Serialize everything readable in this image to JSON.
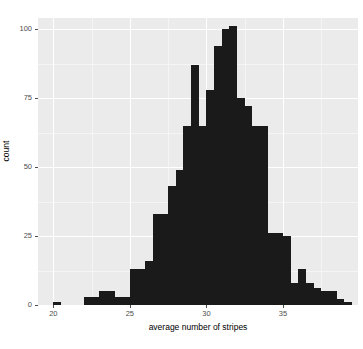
{
  "chart_data": {
    "type": "bar",
    "subtype": "histogram",
    "title": "",
    "xlabel": "average number of stripes",
    "ylabel": "count",
    "xlim": [
      19.0,
      39.9
    ],
    "ylim": [
      0,
      104
    ],
    "xticks": [
      20,
      25,
      30,
      35
    ],
    "yticks": [
      0,
      25,
      50,
      75,
      100
    ],
    "xtick_labels": [
      "20",
      "25",
      "30",
      "35"
    ],
    "ytick_labels": [
      "0",
      "25",
      "50",
      "75",
      "100"
    ],
    "grid": true,
    "legend": null,
    "binwidth": 0.5,
    "bar_color": "#1a1a1a",
    "panel_color": "#ebebeb",
    "gridline_color": "#ffffff",
    "bins": [
      {
        "x": 20.25,
        "count": 1
      },
      {
        "x": 20.75,
        "count": 0
      },
      {
        "x": 21.25,
        "count": 0
      },
      {
        "x": 21.75,
        "count": 0
      },
      {
        "x": 22.25,
        "count": 3
      },
      {
        "x": 22.75,
        "count": 3
      },
      {
        "x": 23.25,
        "count": 5
      },
      {
        "x": 23.75,
        "count": 5
      },
      {
        "x": 24.25,
        "count": 3
      },
      {
        "x": 24.75,
        "count": 3
      },
      {
        "x": 25.25,
        "count": 13
      },
      {
        "x": 25.75,
        "count": 13
      },
      {
        "x": 26.25,
        "count": 16
      },
      {
        "x": 26.75,
        "count": 33
      },
      {
        "x": 27.25,
        "count": 33
      },
      {
        "x": 27.75,
        "count": 43
      },
      {
        "x": 28.25,
        "count": 49
      },
      {
        "x": 28.75,
        "count": 65
      },
      {
        "x": 29.25,
        "count": 87
      },
      {
        "x": 29.75,
        "count": 65
      },
      {
        "x": 30.25,
        "count": 78
      },
      {
        "x": 30.75,
        "count": 94
      },
      {
        "x": 31.25,
        "count": 100
      },
      {
        "x": 31.75,
        "count": 101
      },
      {
        "x": 32.25,
        "count": 75
      },
      {
        "x": 32.75,
        "count": 72
      },
      {
        "x": 33.25,
        "count": 65
      },
      {
        "x": 33.75,
        "count": 65
      },
      {
        "x": 34.25,
        "count": 26
      },
      {
        "x": 34.75,
        "count": 26
      },
      {
        "x": 35.25,
        "count": 25
      },
      {
        "x": 35.75,
        "count": 8
      },
      {
        "x": 36.25,
        "count": 13
      },
      {
        "x": 36.75,
        "count": 8
      },
      {
        "x": 37.25,
        "count": 6
      },
      {
        "x": 37.75,
        "count": 5
      },
      {
        "x": 38.25,
        "count": 5
      },
      {
        "x": 38.75,
        "count": 2
      },
      {
        "x": 39.25,
        "count": 1
      }
    ]
  }
}
